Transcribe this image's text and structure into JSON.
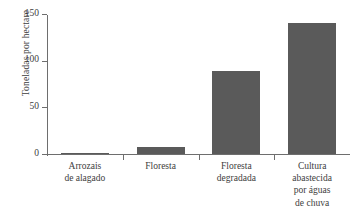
{
  "chart_data": {
    "type": "bar",
    "title": "",
    "xlabel": "",
    "ylabel": "Toneladas por hectare",
    "categories": [
      "Arrozais de alagado",
      "Floresta",
      "Floresta degradada",
      "Cultura abastecida por águas de chuva"
    ],
    "category_lines": [
      [
        "Arrozais",
        "de alagado"
      ],
      [
        "Floresta"
      ],
      [
        "Floresta",
        "degradada"
      ],
      [
        "Cultura",
        "abastecida",
        "por águas",
        "de chuva"
      ]
    ],
    "values": [
      1,
      8,
      89,
      140
    ],
    "ylim": [
      0,
      150
    ],
    "yticks": [
      0,
      50,
      100,
      150
    ],
    "ytick_labels": [
      "0",
      "50",
      "100",
      "150"
    ],
    "grid": false,
    "legend": null,
    "bar_color": "#5a5a5a",
    "axis_color": "#6e6e6e",
    "text_color": "#3d3d3d",
    "background": "#ffffff"
  }
}
